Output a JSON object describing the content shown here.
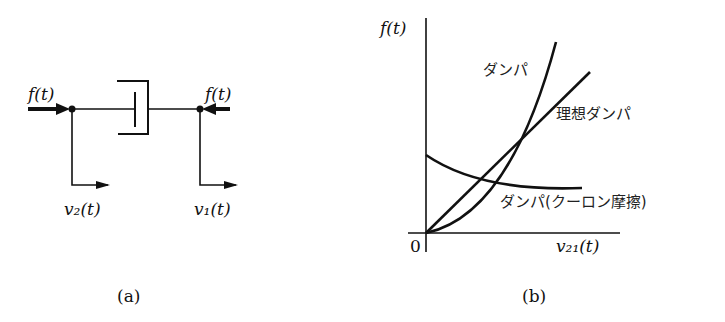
{
  "panel_a": {
    "caption": "(a)",
    "force_left": "f(t)",
    "force_right": "f(t)",
    "velocity_left": "v₂(t)",
    "velocity_right": "v₁(t)",
    "element": "damper"
  },
  "panel_b": {
    "caption": "(b)",
    "y_axis_label": "f(t)",
    "x_axis_label": "v₂₁(t)",
    "origin_label": "0",
    "curves": [
      {
        "name": "damper",
        "label": "ダンパ",
        "shape": "convex increasing"
      },
      {
        "name": "ideal-damper",
        "label": "理想ダンパ",
        "shape": "linear"
      },
      {
        "name": "coulomb-friction-damper",
        "label": "ダンパ(クーロン摩擦)",
        "shape": "decreasing to constant"
      }
    ]
  }
}
